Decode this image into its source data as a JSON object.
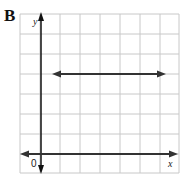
{
  "figure": {
    "panel_label": "B",
    "x_axis_label": "x",
    "y_axis_label": "y",
    "origin_label": "0",
    "grid": {
      "columns": 8,
      "rows": 8,
      "color": "#c8c8c8"
    },
    "line": {
      "type": "horizontal",
      "direction": "both arrows",
      "y_row_from_bottom": 4,
      "color": "#333333"
    }
  }
}
